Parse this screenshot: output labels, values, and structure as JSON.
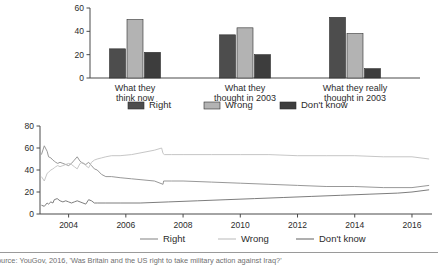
{
  "caption": {
    "text": "Source: YouGov, 2016, 'Was Britain and the US right to take military action against Iraq?'"
  },
  "colors": {
    "right": "#4d4d4d",
    "wrong": "#b3b3b3",
    "dont_know": "#3d3d3d",
    "line_right": "#8c8c8c",
    "line_wrong": "#c0c0c0",
    "line_dont_know": "#6e6e6e",
    "axis": "#4a4a4a",
    "rule": "#9a9a9a"
  },
  "chart_data": [
    {
      "type": "bar",
      "title": "",
      "xlabel": "",
      "ylabel": "",
      "ylim": [
        0,
        60
      ],
      "yticks": [
        0,
        20,
        40,
        60
      ],
      "ytick_labels": [
        "0",
        "20",
        "40",
        "60"
      ],
      "grid": false,
      "legend_position": "bottom",
      "categories": [
        "What they think now",
        "What they thought in 2003",
        "What they really thought in 2003"
      ],
      "category_lines": [
        [
          "What they",
          "think now"
        ],
        [
          "What they",
          "thought in 2003"
        ],
        [
          "What they really",
          "thought in 2003"
        ]
      ],
      "series": [
        {
          "name": "Right",
          "values": [
            25,
            37,
            52
          ]
        },
        {
          "name": "Wrong",
          "values": [
            50,
            43,
            38
          ]
        },
        {
          "name": "Don't know",
          "values": [
            22,
            20,
            8
          ]
        }
      ]
    },
    {
      "type": "line",
      "title": "",
      "xlabel": "",
      "ylabel": "",
      "ylim": [
        0,
        80
      ],
      "yticks": [
        0,
        20,
        40,
        60,
        80
      ],
      "ytick_labels": [
        "0",
        "20",
        "40",
        "60",
        "80"
      ],
      "xlim": [
        2003.0,
        2016.7
      ],
      "xticks": [
        2004,
        2006,
        2008,
        2010,
        2012,
        2014,
        2016
      ],
      "xtick_labels": [
        "2004",
        "2006",
        "2008",
        "2010",
        "2012",
        "2014",
        "2016"
      ],
      "grid": false,
      "legend_position": "bottom",
      "series": [
        {
          "name": "Right",
          "x": [
            2003.05,
            2003.15,
            2003.25,
            2003.3,
            2003.38,
            2003.45,
            2003.5,
            2003.55,
            2003.62,
            2003.7,
            2003.8,
            2003.9,
            2004.0,
            2004.1,
            2004.2,
            2004.3,
            2004.4,
            2004.5,
            2004.6,
            2004.7,
            2004.8,
            2004.9,
            2005.0,
            2005.15,
            2005.3,
            2005.5,
            2005.8,
            2006.2,
            2006.6,
            2007.0,
            2007.3,
            2007.32,
            2007.6,
            2008.0,
            2009.0,
            2010.0,
            2011.0,
            2012.0,
            2013.0,
            2014.0,
            2015.0,
            2016.0,
            2016.6
          ],
          "y": [
            54,
            62,
            57,
            52,
            51,
            49,
            48,
            47,
            46,
            47,
            46,
            45,
            44,
            46,
            49,
            52,
            48,
            46,
            45,
            47,
            44,
            41,
            40,
            36,
            34,
            34,
            33,
            32,
            31,
            30,
            27,
            30,
            30,
            30,
            29,
            28,
            27,
            26,
            25,
            25,
            24,
            24,
            26
          ]
        },
        {
          "name": "Wrong",
          "x": [
            2003.05,
            2003.15,
            2003.25,
            2003.3,
            2003.38,
            2003.45,
            2003.5,
            2003.55,
            2003.62,
            2003.7,
            2003.8,
            2003.9,
            2004.0,
            2004.1,
            2004.2,
            2004.3,
            2004.4,
            2004.5,
            2004.6,
            2004.7,
            2004.8,
            2004.9,
            2005.0,
            2005.15,
            2005.3,
            2005.5,
            2005.8,
            2006.2,
            2006.6,
            2007.0,
            2007.25,
            2007.3,
            2007.35,
            2007.6,
            2008.0,
            2009.0,
            2010.0,
            2011.0,
            2012.0,
            2013.0,
            2014.0,
            2015.0,
            2016.0,
            2016.6
          ],
          "y": [
            34,
            30,
            37,
            38,
            40,
            41,
            42,
            43,
            44,
            43,
            44,
            45,
            46,
            45,
            43,
            41,
            46,
            47,
            44,
            42,
            47,
            49,
            50,
            51,
            52,
            53,
            53,
            54,
            56,
            58,
            60,
            55,
            54,
            54,
            54,
            54,
            54,
            54,
            53,
            53,
            53,
            52,
            52,
            50
          ]
        },
        {
          "name": "Don't know",
          "x": [
            2003.05,
            2003.15,
            2003.25,
            2003.3,
            2003.38,
            2003.45,
            2003.5,
            2003.6,
            2003.7,
            2003.8,
            2003.9,
            2004.0,
            2004.1,
            2004.2,
            2004.3,
            2004.4,
            2004.5,
            2004.6,
            2004.7,
            2004.8,
            2004.9,
            2005.0,
            2005.3,
            2005.8,
            2006.5,
            2007.5,
            2008.5,
            2009.5,
            2010.5,
            2011.5,
            2012.5,
            2013.5,
            2014.5,
            2015.5,
            2016.0,
            2016.6
          ],
          "y": [
            8,
            7,
            10,
            9,
            11,
            10,
            13,
            14,
            12,
            11,
            12,
            11,
            10,
            11,
            12,
            11,
            10,
            9,
            13,
            12,
            10,
            10,
            10,
            10,
            10,
            11,
            12,
            13,
            14,
            15,
            16,
            17,
            18,
            19,
            20,
            22
          ]
        }
      ]
    }
  ]
}
